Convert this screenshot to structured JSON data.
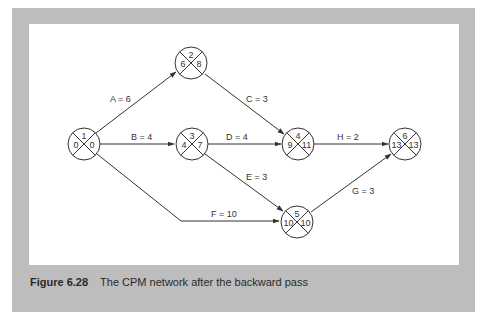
{
  "figure": {
    "number": "Figure 6.28",
    "caption": "The CPM network after the backward pass"
  },
  "colors": {
    "frame": "#bdbdbd",
    "panel": "#ffffff",
    "line": "#333333"
  },
  "nodes": [
    {
      "id": "1",
      "event": "1",
      "earliest": "0",
      "latest": "0",
      "cx": 84,
      "cy": 144
    },
    {
      "id": "2",
      "event": "2",
      "earliest": "6",
      "latest": "8",
      "cx": 191,
      "cy": 63
    },
    {
      "id": "3",
      "event": "3",
      "earliest": "4",
      "latest": "7",
      "cx": 192,
      "cy": 144
    },
    {
      "id": "4",
      "event": "4",
      "earliest": "9",
      "latest": "11",
      "cx": 298,
      "cy": 144
    },
    {
      "id": "5",
      "event": "5",
      "earliest": "10",
      "latest": "10",
      "cx": 297,
      "cy": 222
    },
    {
      "id": "6",
      "event": "6",
      "earliest": "13",
      "latest": "13",
      "cx": 405,
      "cy": 144
    }
  ],
  "activities": [
    {
      "id": "A",
      "label": "A = 6",
      "from": "1",
      "to": "2",
      "duration": 6
    },
    {
      "id": "B",
      "label": "B = 4",
      "from": "1",
      "to": "3",
      "duration": 4
    },
    {
      "id": "C",
      "label": "C = 3",
      "from": "2",
      "to": "4",
      "duration": 3
    },
    {
      "id": "D",
      "label": "D = 4",
      "from": "3",
      "to": "4",
      "duration": 4
    },
    {
      "id": "E",
      "label": "E = 3",
      "from": "3",
      "to": "5",
      "duration": 3
    },
    {
      "id": "F",
      "label": "F = 10",
      "from": "1",
      "to": "5",
      "duration": 10
    },
    {
      "id": "G",
      "label": "G = 3",
      "from": "5",
      "to": "6",
      "duration": 3
    },
    {
      "id": "H",
      "label": "H = 2",
      "from": "4",
      "to": "6",
      "duration": 2
    }
  ]
}
